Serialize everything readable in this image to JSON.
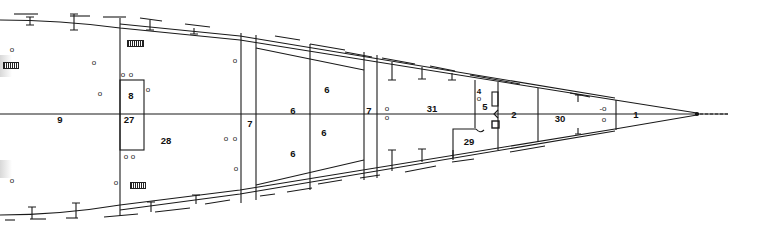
{
  "diagram": {
    "type": "hull-deck-plan",
    "compartments": [
      {
        "id": "9",
        "label": "9",
        "x": 60,
        "y": 120
      },
      {
        "id": "27",
        "label": "27",
        "x": 129,
        "y": 120
      },
      {
        "id": "8",
        "label": "8",
        "x": 131,
        "y": 96
      },
      {
        "id": "28",
        "label": "28",
        "x": 166,
        "y": 141
      },
      {
        "id": "7a",
        "label": "7",
        "x": 250,
        "y": 124
      },
      {
        "id": "6a",
        "label": "6",
        "x": 293,
        "y": 111
      },
      {
        "id": "6b",
        "label": "6",
        "x": 327,
        "y": 90
      },
      {
        "id": "6c",
        "label": "6",
        "x": 324,
        "y": 133
      },
      {
        "id": "6d",
        "label": "6",
        "x": 293,
        "y": 154
      },
      {
        "id": "7b",
        "label": "7",
        "x": 369,
        "y": 111
      },
      {
        "id": "31",
        "label": "31",
        "x": 432,
        "y": 109
      },
      {
        "id": "4",
        "label": "4",
        "x": 479,
        "y": 92
      },
      {
        "id": "5",
        "label": "5",
        "x": 485,
        "y": 107
      },
      {
        "id": "3",
        "label": "3",
        "x": 494,
        "y": 124
      },
      {
        "id": "29",
        "label": "29",
        "x": 469,
        "y": 142
      },
      {
        "id": "2",
        "label": "2",
        "x": 514,
        "y": 115
      },
      {
        "id": "30",
        "label": "30",
        "x": 560,
        "y": 119
      },
      {
        "id": "1",
        "label": "1",
        "x": 636,
        "y": 115
      }
    ],
    "holes": [
      {
        "label": "o",
        "x": 12,
        "y": 50
      },
      {
        "label": "o",
        "x": 94,
        "y": 63
      },
      {
        "label": "o",
        "x": 100,
        "y": 94
      },
      {
        "label": "o",
        "x": 123,
        "y": 75
      },
      {
        "label": "o",
        "x": 131,
        "y": 75
      },
      {
        "label": "o",
        "x": 148,
        "y": 90
      },
      {
        "label": "o",
        "x": 235,
        "y": 61
      },
      {
        "label": "o",
        "x": 12,
        "y": 181
      },
      {
        "label": "o",
        "x": 116,
        "y": 183
      },
      {
        "label": "o",
        "x": 126,
        "y": 157
      },
      {
        "label": "o",
        "x": 133,
        "y": 157
      },
      {
        "label": "o",
        "x": 226,
        "y": 139
      },
      {
        "label": "o",
        "x": 235,
        "y": 139
      },
      {
        "label": "o",
        "x": 236,
        "y": 169
      },
      {
        "label": "o",
        "x": 387,
        "y": 109
      },
      {
        "label": "o",
        "x": 387,
        "y": 118
      },
      {
        "label": "o",
        "x": 479,
        "y": 99
      },
      {
        "label": "-o",
        "x": 603,
        "y": 109
      },
      {
        "label": "o",
        "x": 604,
        "y": 120
      }
    ],
    "vents": [
      {
        "name": "vent-top-left",
        "x": 127,
        "y": 40,
        "w": 17
      },
      {
        "name": "vent-edge-left",
        "x": 3,
        "y": 62,
        "w": 16
      },
      {
        "name": "vent-bottom",
        "x": 130,
        "y": 182,
        "w": 16
      }
    ],
    "colors": {
      "line": "#1a1a1a",
      "background": "#ffffff"
    }
  }
}
